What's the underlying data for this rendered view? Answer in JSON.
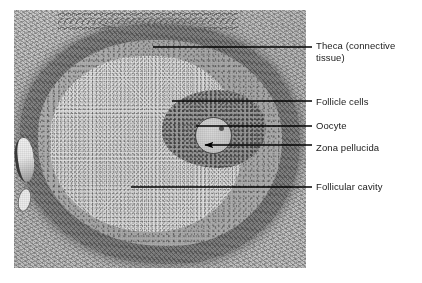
{
  "figure": {
    "kind": "labeled-histology-micrograph",
    "background_color": "#ffffff",
    "label_color": "#1a1a1a",
    "leader_color": "#000000"
  },
  "micrograph": {
    "alt": "Light micrograph of a mammalian ovarian follicle in cross section",
    "frame": {
      "x": 14,
      "y": 10,
      "width": 292,
      "height": 258
    },
    "tones": {
      "stroma": "#c3c3c3",
      "theca_ring": "#7b7b7b",
      "granulosa": "#ababab",
      "cavity": "#e2e2e2",
      "oocyte": "#c9c9c9",
      "outline": "#4a4a4a"
    }
  },
  "labels": [
    {
      "id": "theca",
      "text": "Theca (connective\ntissue)",
      "leader": {
        "x1": 153,
        "y1": 47,
        "x2": 312,
        "y2": 47
      },
      "arrow": false
    },
    {
      "id": "follicle-cells",
      "text": "Follicle cells",
      "leader": {
        "x1": 172,
        "y1": 101,
        "x2": 312,
        "y2": 101
      },
      "arrow": false
    },
    {
      "id": "oocyte",
      "text": "Oocyte",
      "leader": {
        "x1": 196,
        "y1": 126,
        "x2": 312,
        "y2": 126
      },
      "arrow": false
    },
    {
      "id": "zona-pellucida",
      "text": "Zona pellucida",
      "leader": {
        "x1": 205,
        "y1": 145,
        "x2": 312,
        "y2": 145
      },
      "arrow": true
    },
    {
      "id": "follicular-cavity",
      "text": "Follicular cavity",
      "leader": {
        "x1": 131,
        "y1": 187,
        "x2": 312,
        "y2": 187
      },
      "arrow": false
    }
  ]
}
